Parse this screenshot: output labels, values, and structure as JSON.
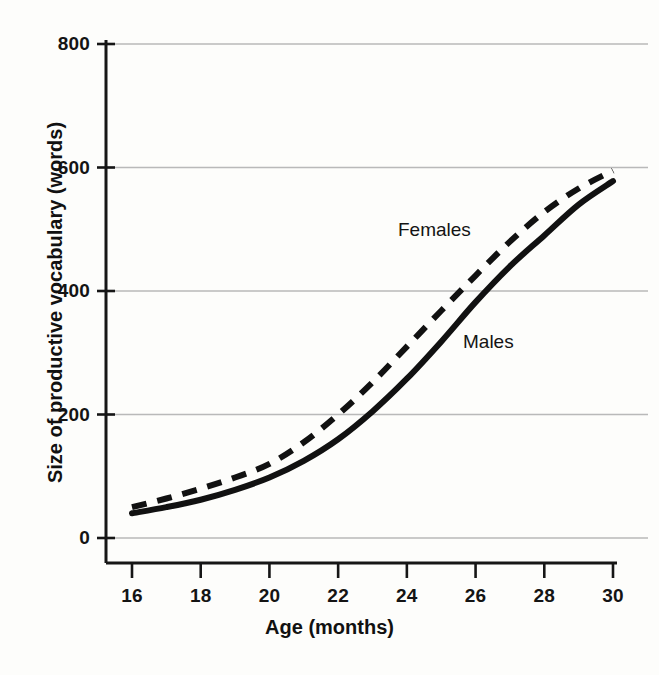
{
  "figure": {
    "background_color": "#fdfdfb",
    "ink_color": "#111111",
    "gridline_color": "#b9b9b9"
  },
  "axes": {
    "x_title": "Age (months)",
    "y_title": "Size of productive vocabulary (words)",
    "x_ticks": [
      "16",
      "18",
      "20",
      "22",
      "24",
      "26",
      "28",
      "30"
    ],
    "y_ticks": [
      "800",
      "600",
      "400",
      "200",
      "0"
    ]
  },
  "series_labels": {
    "females": "Females",
    "males": "Males"
  },
  "chart_data": {
    "type": "line",
    "title": "",
    "xlabel": "Age (months)",
    "ylabel": "Size of productive vocabulary (words)",
    "xlim": [
      16,
      30
    ],
    "ylim": [
      0,
      800
    ],
    "x": [
      16,
      17,
      18,
      19,
      20,
      21,
      22,
      23,
      24,
      25,
      26,
      27,
      28,
      29,
      30
    ],
    "xticks": [
      16,
      18,
      20,
      22,
      24,
      26,
      28,
      30
    ],
    "yticks": [
      0,
      200,
      400,
      600,
      800
    ],
    "grid": "horizontal",
    "legend": "inline-labels",
    "series": [
      {
        "name": "Females",
        "style": "dashed",
        "color": "#111111",
        "label_position": {
          "x": 24.2,
          "y": 480
        },
        "values": [
          50,
          64,
          80,
          98,
          120,
          155,
          200,
          252,
          310,
          368,
          425,
          480,
          528,
          566,
          595
        ]
      },
      {
        "name": "Males",
        "style": "solid",
        "color": "#111111",
        "label_position": {
          "x": 25.9,
          "y": 345
        },
        "values": [
          40,
          50,
          62,
          78,
          98,
          125,
          160,
          205,
          258,
          318,
          382,
          440,
          490,
          540,
          578
        ]
      }
    ]
  }
}
